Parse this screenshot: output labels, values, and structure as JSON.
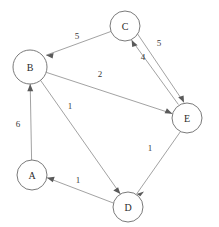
{
  "diagram": {
    "type": "directed-weighted-graph",
    "canvas": {
      "width": 219,
      "height": 227,
      "background": "#ffffff"
    },
    "style": {
      "node_stroke": "#6b6b6b",
      "node_fill": "#ffffff",
      "edge_stroke": "#8a8a8a",
      "label_color": "#2b2b2b"
    },
    "nodes": [
      {
        "id": "A",
        "label": "A",
        "cx": 32,
        "cy": 175,
        "r": 15
      },
      {
        "id": "B",
        "label": "B",
        "cx": 30,
        "cy": 67,
        "r": 17
      },
      {
        "id": "C",
        "label": "C",
        "cx": 125,
        "cy": 26,
        "r": 15
      },
      {
        "id": "D",
        "label": "D",
        "cx": 128,
        "cy": 207,
        "r": 15
      },
      {
        "id": "E",
        "label": "E",
        "cx": 187,
        "cy": 118,
        "r": 15
      }
    ],
    "edges": [
      {
        "id": "C-B",
        "from": "C",
        "to": "B",
        "weight": "5",
        "label_x": 77,
        "label_y": 36
      },
      {
        "id": "B-E",
        "from": "B",
        "to": "E",
        "weight": "2",
        "label_x": 100,
        "label_y": 74
      },
      {
        "id": "C-E",
        "from": "C",
        "to": "E",
        "weight": "5",
        "label_x": 159,
        "label_y": 43
      },
      {
        "id": "E-C",
        "from": "E",
        "to": "C",
        "weight": "4",
        "label_x": 143,
        "label_y": 57
      },
      {
        "id": "A-B",
        "from": "A",
        "to": "B",
        "weight": "6",
        "label_x": 18,
        "label_y": 124
      },
      {
        "id": "B-D",
        "from": "B",
        "to": "D",
        "weight": "1",
        "label_x": 70,
        "label_y": 106
      },
      {
        "id": "D-A",
        "from": "D",
        "to": "A",
        "weight": "1",
        "label_x": 78,
        "label_y": 180
      },
      {
        "id": "E-D",
        "from": "E",
        "to": "D",
        "weight": "1",
        "label_x": 150,
        "label_y": 148
      }
    ]
  }
}
